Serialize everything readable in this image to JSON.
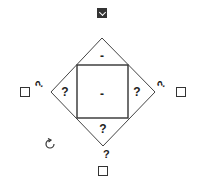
{
  "diagram": {
    "top_triangle_label": "-",
    "center_square_label": "-",
    "left_triangle_label": "?",
    "right_triangle_label": "?",
    "bottom_triangle_label": "?",
    "left_rotated_hint": "?",
    "right_rotated_hint": "?",
    "bottom_hint": "?"
  },
  "controls": {
    "top_checkbox_checked": true,
    "left_checkbox_checked": false,
    "right_checkbox_checked": false,
    "bottom_checkbox_checked": false,
    "rotate_icon": "rotate-icon"
  }
}
